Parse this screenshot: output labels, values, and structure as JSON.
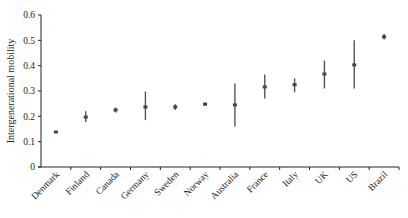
{
  "chart_data": {
    "type": "scatter",
    "subtype": "point-with-error-bars",
    "title": "",
    "xlabel": "",
    "ylabel": "Intergenerational mobility",
    "ylim": [
      0,
      0.6
    ],
    "yticks": [
      0,
      0.1,
      0.2,
      0.3,
      0.4,
      0.5,
      0.6
    ],
    "ytick_labels": [
      "0",
      "0.1",
      "0.2",
      "0.3",
      "0.4",
      "0.5",
      "0.6"
    ],
    "grid": false,
    "legend": null,
    "categories": [
      "Denmark",
      "Finland",
      "Canada",
      "Germany",
      "Sweden",
      "Norway",
      "Australia",
      "France",
      "Italy",
      "UK",
      "US",
      "Brazil"
    ],
    "values": [
      0.138,
      0.197,
      0.225,
      0.237,
      0.237,
      0.248,
      0.245,
      0.316,
      0.325,
      0.367,
      0.403,
      0.514
    ],
    "lower": [
      0.134,
      0.178,
      0.215,
      0.185,
      0.225,
      0.242,
      0.16,
      0.27,
      0.295,
      0.31,
      0.31,
      0.503
    ],
    "upper": [
      0.142,
      0.22,
      0.235,
      0.298,
      0.248,
      0.255,
      0.33,
      0.365,
      0.35,
      0.42,
      0.5,
      0.525
    ]
  },
  "colors": {
    "axis": "#222222",
    "marker": "#444444",
    "errorbar": "#555555"
  }
}
